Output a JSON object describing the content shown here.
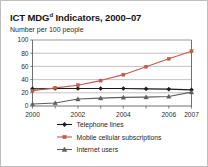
{
  "chart_data": {
    "type": "line",
    "title_main": "ICT MDG",
    "title_superscript": "d",
    "title_rest": " Indicators, 2000–07",
    "subtitle": "Number per 100 people",
    "xlabel": "",
    "ylabel": "",
    "ylim": [
      0,
      100
    ],
    "yticks": [
      0,
      20,
      40,
      60,
      80,
      100
    ],
    "ytick_labels": [
      "0",
      "20",
      "40",
      "60",
      "80",
      "100"
    ],
    "x": [
      2000,
      2001,
      2002,
      2003,
      2004,
      2005,
      2006,
      2007
    ],
    "xtick_labels": [
      "2000",
      "2002",
      "2004",
      "2006",
      "2007"
    ],
    "xticks_shown": [
      2000,
      2002,
      2004,
      2006,
      2007
    ],
    "grid": true,
    "legend_position": "bottom",
    "series": [
      {
        "name": "Telephone lines",
        "color": "#1a1a1a",
        "marker": "diamond",
        "values": [
          26,
          26.5,
          26.5,
          26.5,
          26.5,
          26,
          25.5,
          24.5
        ]
      },
      {
        "name": "Mobile cellular subscriptions",
        "color": "#c2594b",
        "marker": "square",
        "values": [
          23,
          27.5,
          31.5,
          38.5,
          47.5,
          59.5,
          71.5,
          83
        ]
      },
      {
        "name": "Internet users",
        "color": "#5e5e5e",
        "marker": "triangle",
        "values": [
          3,
          4.5,
          10.5,
          12,
          13,
          13.5,
          14.5,
          21
        ]
      }
    ]
  },
  "legend": {
    "items": [
      {
        "label": "Telephone lines"
      },
      {
        "label": "Mobile cellular subscriptions"
      },
      {
        "label": "Internet users"
      }
    ]
  },
  "colors": {
    "telephone": "#1a1a1a",
    "mobile": "#c2594b",
    "internet": "#5e5e5e",
    "grid": "#9a9a9a",
    "axis": "#4a4a4a",
    "border": "#bdbdbd",
    "text": "#1f1f1f"
  }
}
